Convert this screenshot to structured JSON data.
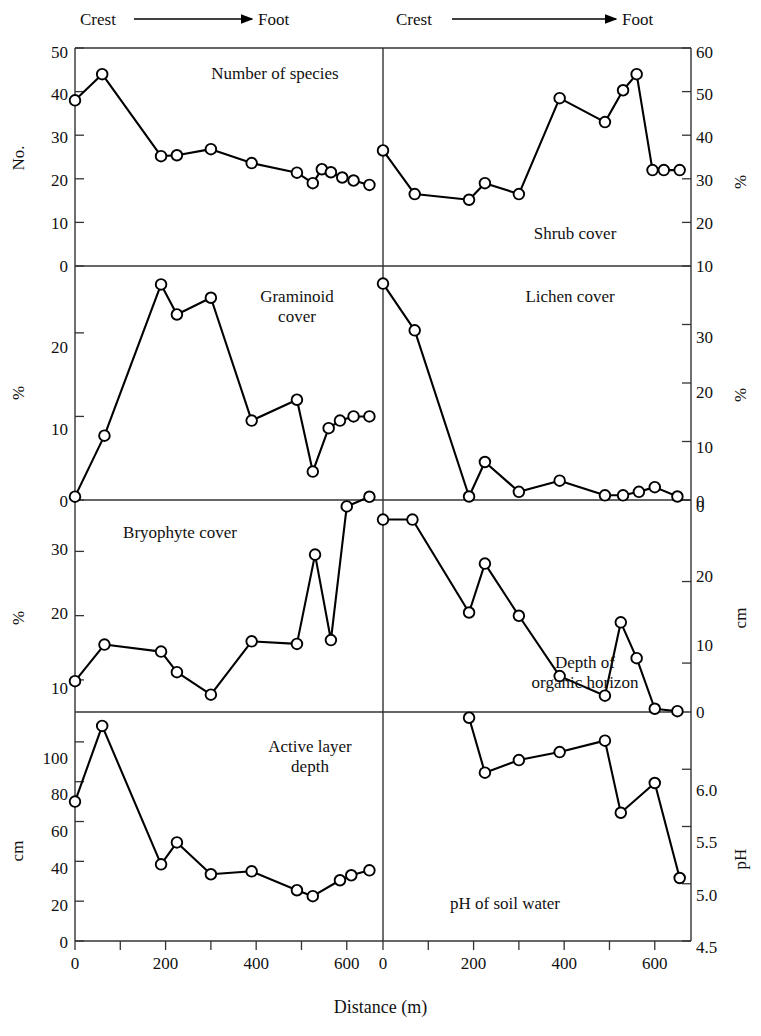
{
  "figure": {
    "x_axis_title": "Distance (m)",
    "x_ticks_labeled": [
      "0",
      "200",
      "400",
      "600"
    ],
    "gradient_left": {
      "start": "Crest",
      "end": "Foot"
    },
    "gradient_right": {
      "start": "Crest",
      "end": "Foot"
    },
    "marker_style": "open-circle",
    "line_color": "#000000",
    "marker_fill": "#ffffff"
  },
  "panels": {
    "species": {
      "title": "Number of species",
      "y_label": "No.",
      "y_ticks": [
        "0",
        "10",
        "20",
        "30",
        "40",
        "50"
      ]
    },
    "shrub": {
      "title": "Shrub cover",
      "y_label": "%",
      "y_ticks": [
        "10",
        "20",
        "30",
        "40",
        "50",
        "60"
      ]
    },
    "graminoid": {
      "title_line1": "Graminoid",
      "title_line2": "cover",
      "y_label": "%",
      "y_ticks": [
        "0",
        "10",
        "20"
      ]
    },
    "lichen": {
      "title": "Lichen cover",
      "y_label": "%",
      "y_ticks": [
        "0",
        "10",
        "20",
        "30"
      ]
    },
    "bryophyte": {
      "title": "Bryophyte cover",
      "y_label": "%",
      "y_ticks": [
        "10",
        "20",
        "30"
      ]
    },
    "organic": {
      "title_line1": "Depth of",
      "title_line2": "organic horizon",
      "y_label": "cm",
      "y_ticks": [
        "0",
        "10",
        "20",
        "0"
      ]
    },
    "active": {
      "title_line1": "Active layer",
      "title_line2": "depth",
      "y_label": "cm",
      "y_ticks": [
        "0",
        "20",
        "40",
        "60",
        "80",
        "100"
      ]
    },
    "ph": {
      "title": "pH of soil water",
      "y_label": "pH",
      "y_ticks": [
        "4.5",
        "5.0",
        "5.5",
        "6.0"
      ]
    }
  },
  "chart_data": [
    {
      "id": "species",
      "type": "line",
      "title": "Number of species",
      "xlabel": "Distance (m)",
      "ylabel": "No.",
      "xlim": [
        0,
        680
      ],
      "ylim": [
        0,
        50
      ],
      "grid": false,
      "legend": "none",
      "x": [
        0,
        60,
        190,
        225,
        300,
        390,
        490,
        525,
        545,
        565,
        590,
        615,
        650
      ],
      "y": [
        38,
        44,
        25.2,
        25.4,
        26.8,
        23.6,
        21.4,
        19,
        22.2,
        21.5,
        20.3,
        19.6,
        18.6
      ]
    },
    {
      "id": "shrub",
      "type": "line",
      "title": "Shrub cover",
      "xlabel": "Distance (m)",
      "ylabel": "%",
      "xlim": [
        0,
        680
      ],
      "ylim": [
        10,
        60
      ],
      "grid": false,
      "legend": "none",
      "x": [
        0,
        70,
        190,
        225,
        300,
        390,
        490,
        530,
        560,
        595,
        620,
        655
      ],
      "y": [
        36.5,
        26.5,
        25.2,
        29,
        26.5,
        48.5,
        43,
        50.3,
        54,
        32,
        32,
        32
      ]
    },
    {
      "id": "graminoid",
      "type": "line",
      "title": "Graminoid cover",
      "xlabel": "Distance (m)",
      "ylabel": "%",
      "xlim": [
        0,
        680
      ],
      "ylim": [
        0,
        28
      ],
      "grid": false,
      "legend": "none",
      "x": [
        0,
        65,
        190,
        225,
        300,
        390,
        490,
        525,
        560,
        585,
        615,
        650
      ],
      "y": [
        0.4,
        7.7,
        25.8,
        22.2,
        24.2,
        9.5,
        12,
        3.4,
        8.6,
        9.5,
        10,
        10
      ]
    },
    {
      "id": "lichen",
      "type": "line",
      "title": "Lichen cover",
      "xlabel": "Distance (m)",
      "ylabel": "%",
      "xlim": [
        0,
        680
      ],
      "ylim": [
        0,
        40
      ],
      "grid": false,
      "legend": "none",
      "x": [
        0,
        70,
        190,
        225,
        300,
        390,
        490,
        530,
        565,
        600,
        650
      ],
      "y": [
        37,
        29,
        0.6,
        6.5,
        1.4,
        3.3,
        0.8,
        0.8,
        1.4,
        2.2,
        0.6
      ]
    },
    {
      "id": "bryophyte",
      "type": "line",
      "title": "Bryophyte cover",
      "xlabel": "Distance (m)",
      "ylabel": "%",
      "xlim": [
        0,
        680
      ],
      "ylim": [
        5,
        38
      ],
      "grid": false,
      "legend": "none",
      "x": [
        0,
        65,
        190,
        225,
        300,
        390,
        490,
        530,
        565,
        600,
        650
      ],
      "y": [
        9.8,
        15.5,
        14.4,
        11.2,
        7.7,
        16,
        15.6,
        29.5,
        16.2,
        37,
        38.5
      ]
    },
    {
      "id": "organic",
      "type": "line",
      "title": "Depth of organic horizon",
      "xlabel": "Distance (m)",
      "ylabel": "cm",
      "xlim": [
        0,
        680
      ],
      "ylim": [
        0,
        26
      ],
      "y_inverted": true,
      "grid": false,
      "legend": "none",
      "x": [
        0,
        65,
        190,
        225,
        300,
        390,
        490,
        525,
        560,
        600,
        650
      ],
      "y": [
        2.4,
        2.4,
        13.8,
        7.8,
        14.2,
        21.6,
        24,
        15,
        19.4,
        25.6,
        25.9
      ]
    },
    {
      "id": "active",
      "type": "line",
      "title": "Active layer depth",
      "xlabel": "Distance (m)",
      "ylabel": "cm",
      "xlim": [
        0,
        680
      ],
      "ylim": [
        0,
        115
      ],
      "grid": false,
      "legend": "none",
      "x": [
        0,
        60,
        190,
        225,
        300,
        390,
        490,
        525,
        585,
        610,
        650
      ],
      "y": [
        70,
        108,
        38.5,
        49.5,
        33.5,
        35,
        25.5,
        22.5,
        30.5,
        33,
        35.5
      ]
    },
    {
      "id": "ph",
      "type": "line",
      "title": "pH of soil water",
      "xlabel": "Distance (m)",
      "ylabel": "pH",
      "xlim": [
        0,
        680
      ],
      "ylim": [
        4.5,
        6.5
      ],
      "grid": false,
      "legend": "none",
      "x": [
        190,
        225,
        300,
        390,
        490,
        525,
        600,
        655
      ],
      "y": [
        6.45,
        5.97,
        6.08,
        6.15,
        6.25,
        5.62,
        5.88,
        5.05
      ]
    }
  ]
}
